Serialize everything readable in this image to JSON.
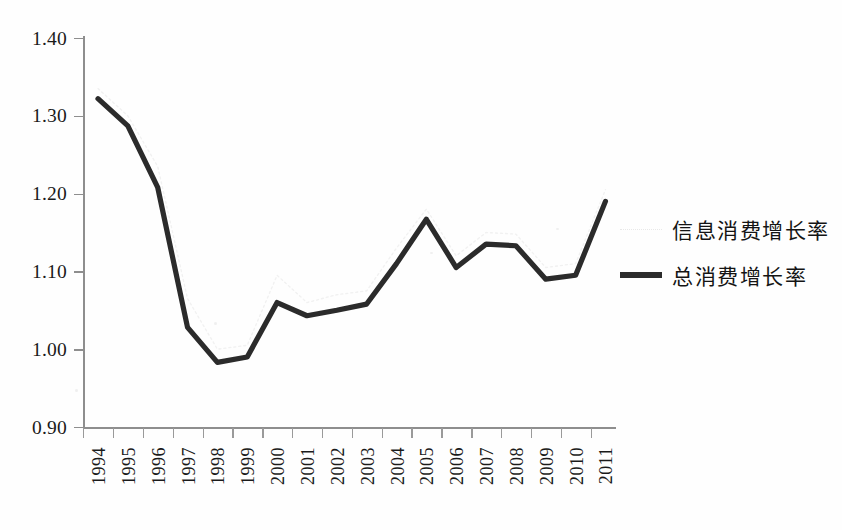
{
  "chart_data": {
    "type": "line",
    "title": "",
    "xlabel": "",
    "ylabel": "",
    "ylim": [
      0.9,
      1.4
    ],
    "ytick_labels": [
      "0.90",
      "1.00",
      "1.10",
      "1.20",
      "1.30",
      "1.40"
    ],
    "ytick_values": [
      0.9,
      1.0,
      1.1,
      1.2,
      1.3,
      1.4
    ],
    "grid": false,
    "legend_position": "right",
    "categories": [
      "1994",
      "1995",
      "1996",
      "1997",
      "1998",
      "1999",
      "2000",
      "2001",
      "2002",
      "2003",
      "2004",
      "2005",
      "2006",
      "2007",
      "2008",
      "2009",
      "2010",
      "2011"
    ],
    "series": [
      {
        "name": "信息消费增长率",
        "style": "faint-dotted",
        "color": "#e6e6e6",
        "values": [
          1.335,
          1.3,
          1.235,
          1.065,
          1.0,
          1.005,
          1.095,
          1.06,
          1.07,
          1.075,
          1.13,
          1.18,
          1.12,
          1.15,
          1.148,
          1.105,
          1.11,
          1.205
        ]
      },
      {
        "name": "总消费增长率",
        "style": "solid-bold",
        "color": "#2b2b2b",
        "values": [
          1.322,
          1.287,
          1.208,
          1.028,
          0.983,
          0.99,
          1.06,
          1.043,
          1.05,
          1.058,
          1.11,
          1.167,
          1.105,
          1.135,
          1.133,
          1.09,
          1.095,
          1.19
        ]
      }
    ]
  },
  "legend": {
    "items": [
      {
        "label": "信息消费增长率",
        "swatch": "faint"
      },
      {
        "label": "总消费增长率",
        "swatch": "bold"
      }
    ]
  }
}
